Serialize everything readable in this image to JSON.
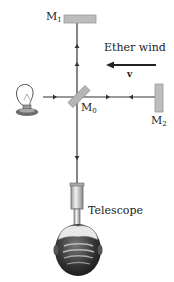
{
  "diagram": {
    "mirrors": [
      {
        "id": "M1",
        "label": "M",
        "sub": "1",
        "role": "top mirror"
      },
      {
        "id": "M0",
        "label": "M",
        "sub": "0",
        "role": "beam splitter"
      },
      {
        "id": "M2",
        "label": "M",
        "sub": "2",
        "role": "right mirror"
      }
    ],
    "ether_wind": {
      "label": "Ether wind",
      "velocity_symbol": "v",
      "direction": "left"
    },
    "telescope": {
      "label": "Telescope"
    },
    "source": {
      "icon": "light-bulb-icon"
    },
    "observer": {
      "icon": "observer-head-icon"
    },
    "colors": {
      "beam": "#333333",
      "mirror_fill": "#bdbdbd",
      "mirror_stroke": "#9a9a9a",
      "text": "#222222",
      "telescope": "#cfcfcf",
      "head": "#3a3a3a"
    }
  }
}
